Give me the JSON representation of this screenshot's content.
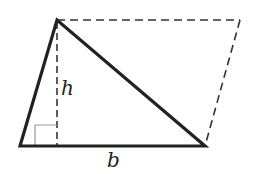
{
  "diagram": {
    "labels": {
      "height": "h",
      "base": "b"
    },
    "colors": {
      "stroke": "#222222",
      "right_angle": "#999999"
    }
  }
}
